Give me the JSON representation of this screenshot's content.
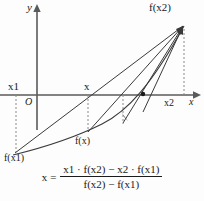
{
  "diagram": {
    "title_text": "",
    "background_color": "#fdfdfd",
    "stroke_color": "#3a3a3a",
    "text_color": "#1a1a1a",
    "axes": {
      "y_axis_label": "y",
      "x_axis_label": "x",
      "origin_label": "O",
      "x_axis_y_px": 95,
      "y_axis_x_px": 37
    },
    "labels": {
      "fx2": "f(x2)",
      "fx1": "f(x1)",
      "fx": "f(x)",
      "x1": "x1",
      "x": "x",
      "x2": "x2"
    },
    "points": {
      "fx1": {
        "x": 15,
        "y": 153
      },
      "fx2": {
        "x": 184,
        "y": 25
      },
      "fx": {
        "x": 88,
        "y": 132
      },
      "x1_on_axis": {
        "x": 16,
        "y": 95
      },
      "x_on_axis": {
        "x": 88,
        "y": 95
      },
      "x2_on_axis": {
        "x": 184,
        "y": 95
      },
      "next_iterate": {
        "x": 143,
        "y": 95
      }
    }
  },
  "formula": {
    "lhs": "x",
    "equals": "=",
    "numerator": "x1 · f(x2) − x2 · f(x1)",
    "denominator": "f(x2) − f(x1)"
  }
}
